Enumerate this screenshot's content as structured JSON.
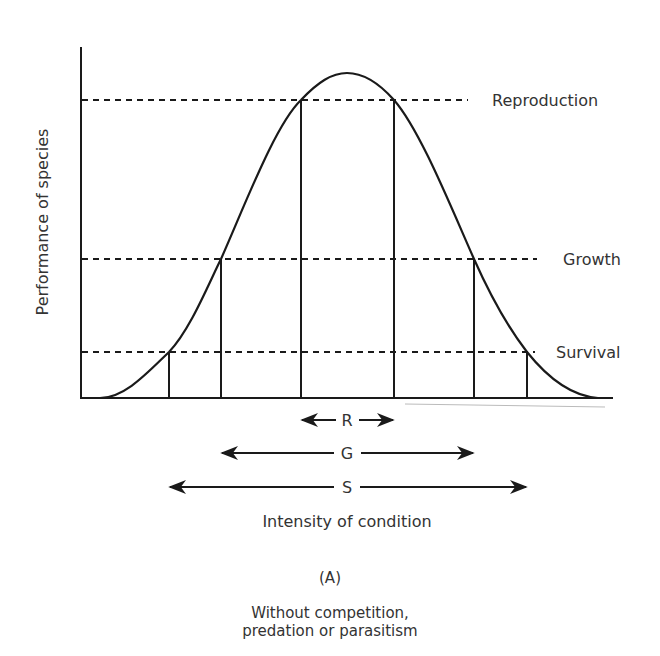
{
  "diagram": {
    "y_axis_label": "Performance of species",
    "x_axis_label": "Intensity of condition",
    "panel_label": "(A)",
    "caption_line1": "Without competition,",
    "caption_line2": "predation or parasitism",
    "levels": [
      {
        "name": "Reproduction",
        "y": 100,
        "x_left": 301,
        "x_right": 394
      },
      {
        "name": "Growth",
        "y": 259,
        "x_left": 221,
        "x_right": 474
      },
      {
        "name": "Survival",
        "y": 352,
        "x_left": 169,
        "x_right": 527
      }
    ],
    "ranges": [
      {
        "letter": "R",
        "meaning": "Reproduction range",
        "y": 420,
        "x_left": 301,
        "x_right": 393
      },
      {
        "letter": "G",
        "meaning": "Growth range",
        "y": 453,
        "x_left": 221,
        "x_right": 474
      },
      {
        "letter": "S",
        "meaning": "Survival range",
        "y": 487,
        "x_left": 169,
        "x_right": 527
      }
    ],
    "curve": {
      "shape": "bell",
      "peak_x": 347,
      "peak_y": 73,
      "baseline_y": 398
    },
    "colors": {
      "line": "#1a1a1a",
      "text": "#333333",
      "background": "#ffffff"
    }
  }
}
